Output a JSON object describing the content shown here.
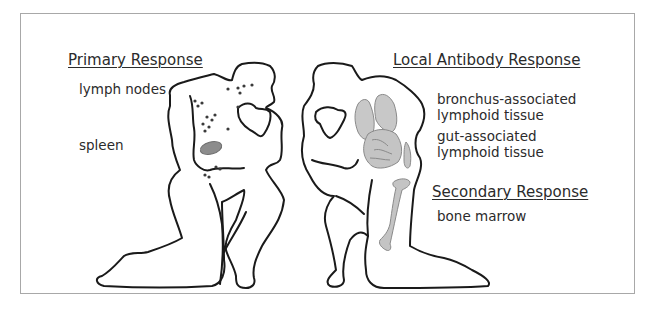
{
  "diagram": {
    "primary": {
      "heading": "Primary Response",
      "labels": [
        "lymph nodes",
        "spleen"
      ]
    },
    "local": {
      "heading": "Local Antibody Response",
      "labels": [
        {
          "line1": "bronchus-associated",
          "line2": "lymphoid tissue"
        },
        {
          "line1": "gut-associated",
          "line2": "lymphoid tissue"
        }
      ]
    },
    "secondary": {
      "heading": "Secondary Response",
      "labels": [
        "bone marrow"
      ]
    },
    "figures": {
      "left": {
        "description": "kneeling human outline with lymph nodes (dots) and spleen (gray)"
      },
      "right": {
        "description": "kneeling human outline with lungs, gut and femur shaded gray"
      }
    },
    "colors": {
      "outline": "#1a1a1a",
      "organ_fill": "#c8c8c8",
      "organ_stroke": "#8a8a8a",
      "spleen_fill": "#8c8c8c",
      "frame": "#a8a8a8"
    }
  }
}
